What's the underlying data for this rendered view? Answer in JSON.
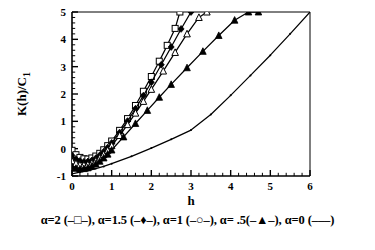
{
  "chart_data": {
    "type": "line",
    "title": "",
    "subtitle": "",
    "xlabel": "h",
    "ylabel": "K(h)/C_1",
    "ylabel_display": "K(h)/C",
    "ylabel_subscript": "1",
    "xlim": [
      0,
      6
    ],
    "ylim": [
      -1,
      5
    ],
    "xticks": [
      0,
      1,
      2,
      3,
      4,
      5,
      6
    ],
    "yticks": [
      -1,
      0,
      1,
      2,
      3,
      4,
      5
    ],
    "xtick_labels": [
      "0",
      "1",
      "2",
      "3",
      "4",
      "5",
      "6"
    ],
    "ytick_labels": [
      "-1",
      "0",
      "1",
      "2",
      "3",
      "4",
      "5"
    ],
    "x_minor_step": 0.2,
    "y_minor_step": 0.2,
    "grid": false,
    "legend_position": "below-figure",
    "frame": "box",
    "series": [
      {
        "name": "alpha=2",
        "alpha": 2,
        "marker": "open-square",
        "marker_filled": false,
        "color": "#000000",
        "x": [
          0.0,
          0.1,
          0.2,
          0.3,
          0.4,
          0.5,
          0.6,
          0.7,
          0.8,
          0.9,
          1.0,
          1.2,
          1.4,
          1.6,
          1.8,
          2.0,
          2.2,
          2.4,
          2.6,
          2.72
        ],
        "y": [
          -0.06,
          -0.22,
          -0.32,
          -0.37,
          -0.38,
          -0.34,
          -0.27,
          -0.17,
          -0.04,
          0.11,
          0.28,
          0.67,
          1.1,
          1.58,
          2.1,
          2.64,
          3.2,
          3.78,
          4.4,
          5.0
        ]
      },
      {
        "name": "alpha=1.5",
        "alpha": 1.5,
        "marker": "filled-diamond",
        "marker_filled": true,
        "color": "#000000",
        "x": [
          0.0,
          0.1,
          0.2,
          0.3,
          0.4,
          0.5,
          0.6,
          0.7,
          0.8,
          0.9,
          1.0,
          1.2,
          1.4,
          1.6,
          1.8,
          2.0,
          2.25,
          2.5,
          2.75,
          3.0
        ],
        "y": [
          -0.25,
          -0.38,
          -0.45,
          -0.48,
          -0.47,
          -0.43,
          -0.35,
          -0.24,
          -0.11,
          0.04,
          0.21,
          0.59,
          1.01,
          1.46,
          1.94,
          2.43,
          3.07,
          3.72,
          4.38,
          5.0
        ]
      },
      {
        "name": "alpha=1",
        "alpha": 1,
        "marker": "open-triangle",
        "marker_filled": false,
        "color": "#000000",
        "x": [
          0.0,
          0.1,
          0.2,
          0.3,
          0.4,
          0.5,
          0.6,
          0.7,
          0.8,
          0.9,
          1.0,
          1.2,
          1.4,
          1.6,
          1.8,
          2.0,
          2.3,
          2.6,
          2.9,
          3.2,
          3.4
        ],
        "y": [
          -0.45,
          -0.54,
          -0.59,
          -0.6,
          -0.58,
          -0.53,
          -0.45,
          -0.34,
          -0.21,
          -0.06,
          0.11,
          0.48,
          0.88,
          1.3,
          1.73,
          2.17,
          2.84,
          3.52,
          4.2,
          4.8,
          5.0
        ]
      },
      {
        "name": "alpha=.5",
        "alpha": 0.5,
        "marker": "filled-triangle",
        "marker_filled": true,
        "color": "#000000",
        "x": [
          0.0,
          0.1,
          0.2,
          0.3,
          0.4,
          0.5,
          0.6,
          0.7,
          0.8,
          0.9,
          1.0,
          1.3,
          1.6,
          1.9,
          2.2,
          2.5,
          2.9,
          3.3,
          3.7,
          4.1,
          4.45,
          4.7
        ],
        "y": [
          -0.66,
          -0.72,
          -0.74,
          -0.73,
          -0.7,
          -0.64,
          -0.56,
          -0.46,
          -0.34,
          -0.2,
          -0.05,
          0.43,
          0.92,
          1.4,
          1.88,
          2.35,
          2.96,
          3.56,
          4.14,
          4.7,
          5.0,
          5.0
        ]
      },
      {
        "name": "alpha=0",
        "alpha": 0,
        "marker": "line-dot",
        "marker_filled": true,
        "color": "#000000",
        "x": [
          0.0,
          0.2,
          0.4,
          0.6,
          0.8,
          1.0,
          1.5,
          2.0,
          2.5,
          3.0,
          3.5,
          4.0,
          4.5,
          5.0,
          5.5,
          6.0
        ],
        "y": [
          -0.92,
          -0.86,
          -0.8,
          -0.73,
          -0.65,
          -0.55,
          -0.28,
          0.02,
          0.34,
          0.68,
          1.25,
          1.95,
          2.68,
          3.42,
          4.2,
          5.0
        ]
      }
    ],
    "legend_entries": [
      {
        "label": "α=2",
        "marker": "open-square",
        "text": "α=2 (–□–)"
      },
      {
        "label": "α=1.5",
        "marker": "filled-diamond",
        "text": "α=1.5 (–♦–)"
      },
      {
        "label": "α=1",
        "marker": "open-circle",
        "text": "α=1 (–○–)"
      },
      {
        "label": "α= .5",
        "marker": "filled-triangle",
        "text": "α= .5(–▲–)"
      },
      {
        "label": "α=0",
        "marker": "plain-line",
        "text": "α=0 (–––)"
      }
    ],
    "caption": "α=2 (–□–), α=1.5 (–♦–), α=1 (–○–), α= .5(–▲–), α=0 (–––)"
  },
  "colors": {
    "ink": "#000000",
    "background": "#ffffff"
  }
}
